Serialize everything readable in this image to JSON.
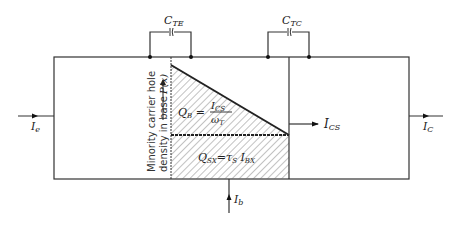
{
  "diagram": {
    "capacitors": {
      "emitter": {
        "label_main": "C",
        "label_sub": "TE"
      },
      "collector": {
        "label_main": "C",
        "label_sub": "TC"
      }
    },
    "currents": {
      "emitter": {
        "label_main": "I",
        "label_sub": "e"
      },
      "collector": {
        "label_main": "I",
        "label_sub": "C"
      },
      "base": {
        "label_main": "I",
        "label_sub": "b"
      },
      "collector_saturation": {
        "label_main": "I",
        "label_sub": "CS"
      }
    },
    "axis_label": {
      "line1": "Minority carrier hole",
      "line2": "density in base",
      "function": "P(x)"
    },
    "regions": {
      "base_charge": {
        "lhs_main": "Q",
        "lhs_sub": "B",
        "num_main": "I",
        "num_sub": "CS",
        "den_main": "ω",
        "den_sub": "T"
      },
      "excess_charge": {
        "lhs_main": "Q",
        "lhs_sub": "SX",
        "rhs_tau": "τ",
        "rhs_tau_sub": "S",
        "rhs_i": "I",
        "rhs_i_sub": "BX"
      }
    },
    "colors": {
      "line": "#333333",
      "hatch": "#555555",
      "background": "#ffffff"
    }
  }
}
